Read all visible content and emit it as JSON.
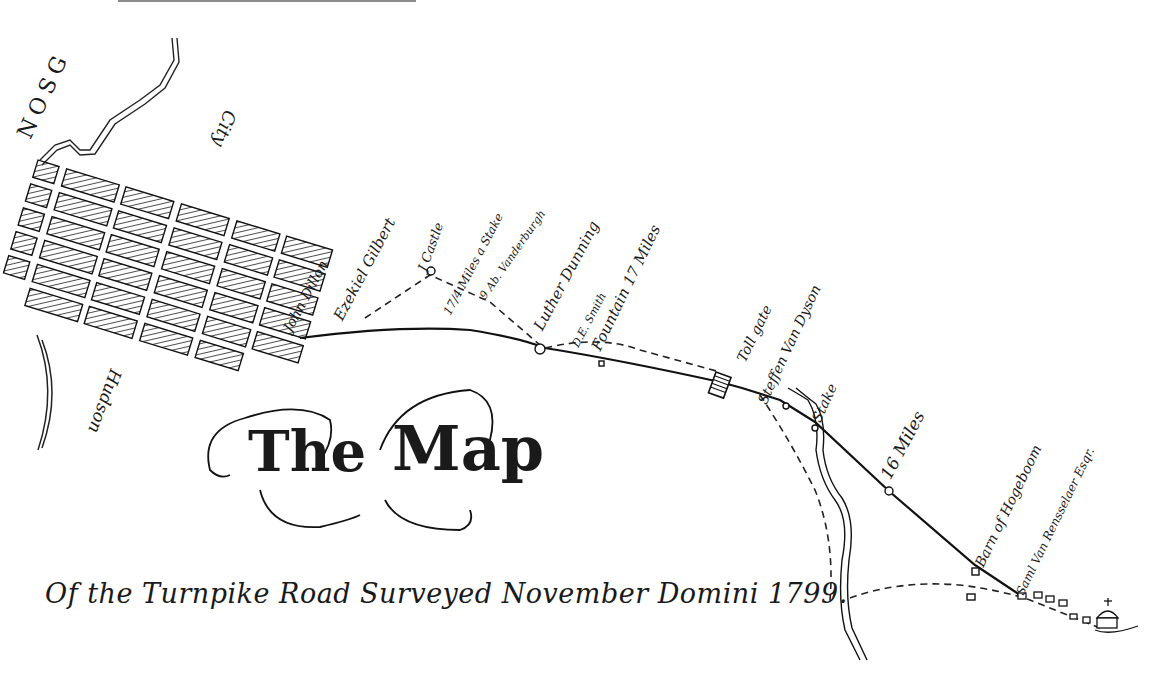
{
  "map": {
    "title": {
      "word1": "The",
      "word2": "Map"
    },
    "caption": "Of the Turnpike Road Surveyed November Domini 1799.",
    "region_labels": {
      "top_left_arc": "NOSG",
      "city": "City",
      "river": "Hudson"
    },
    "route_labels": [
      {
        "id": "john-dillon",
        "text": "John Dillon"
      },
      {
        "id": "ezekiel-gilbert",
        "text": "Ezekiel Gilbert"
      },
      {
        "id": "castle",
        "text": "J Castle"
      },
      {
        "id": "mile-stake",
        "text": "17/4 Miles a Stake"
      },
      {
        "id": "vanderbergh",
        "text": "9 Ab. Vanderburgh"
      },
      {
        "id": "luther-dunning",
        "text": "Luther Dunning"
      },
      {
        "id": "de-smith",
        "text": "D.E. Smith"
      },
      {
        "id": "fountain-miles",
        "text": "Fountain 17 Miles"
      },
      {
        "id": "toll-gate",
        "text": "Toll gate"
      },
      {
        "id": "stephen-van-dyson",
        "text": "Steffen Van Dyson"
      },
      {
        "id": "stake",
        "text": "Stake"
      },
      {
        "id": "sixteen-miles",
        "text": "16 Miles"
      },
      {
        "id": "barn-hogeboom",
        "text": "Barn of Hogeboom"
      },
      {
        "id": "rensselaer",
        "text": "Saml Van Rensselaer Esqr."
      }
    ],
    "footer_text": ""
  }
}
